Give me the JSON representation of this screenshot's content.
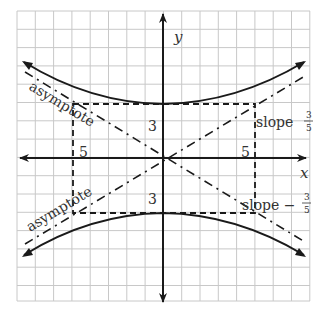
{
  "figure": {
    "type": "hyperbola-graph",
    "equation_form": "y^2/9 - x^2/25 = 1",
    "axes": {
      "x_label": "x",
      "y_label": "y"
    },
    "rectangle_labels": {
      "half_width_left": "5",
      "half_width_right": "5",
      "half_height_top": "3",
      "half_height_bottom": "3"
    },
    "asymptote_labels": {
      "upper_left": "asymptote",
      "lower_left": "asymptote"
    },
    "slope_labels": {
      "upper_right": {
        "text": "slope",
        "num": "3",
        "den": "5"
      },
      "lower_right": {
        "text": "slope −",
        "num": "3",
        "den": "5"
      }
    },
    "colors": {
      "grid": "#c8c8c8",
      "ink": "#1a1a1a",
      "background": "#ffffff"
    }
  }
}
